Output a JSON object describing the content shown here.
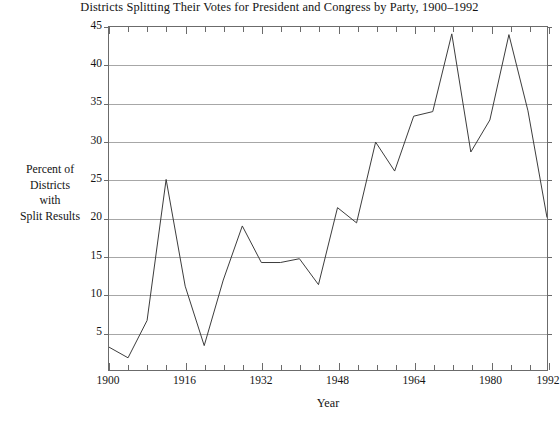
{
  "chart_data": {
    "type": "line",
    "title": "Districts Splitting Their Votes for President and Congress by Party, 1900–1992",
    "xlabel": "Year",
    "ylabel_lines": [
      "Percent of",
      "Districts",
      "with",
      "Split Results"
    ],
    "ylabel": "Percent of Districts with Split Results",
    "xlim": [
      1900,
      1992
    ],
    "ylim": [
      0,
      45
    ],
    "grid": true,
    "legend": "none",
    "ytick_labels": [
      "5",
      "10",
      "15",
      "20",
      "25",
      "30",
      "35",
      "40",
      "45"
    ],
    "yticks": [
      5,
      10,
      15,
      20,
      25,
      30,
      35,
      40,
      45
    ],
    "xtick_labels": [
      "1900",
      "1916",
      "1932",
      "1948",
      "1964",
      "1980",
      "1992"
    ],
    "xticks": [
      1900,
      1916,
      1932,
      1948,
      1964,
      1980,
      1992
    ],
    "x_minor_interval": 4,
    "x": [
      1900,
      1904,
      1908,
      1912,
      1916,
      1920,
      1924,
      1928,
      1932,
      1936,
      1940,
      1944,
      1948,
      1952,
      1956,
      1960,
      1964,
      1968,
      1972,
      1976,
      1980,
      1984,
      1988,
      1992
    ],
    "values": [
      3.0,
      1.6,
      6.5,
      25.0,
      11.0,
      3.2,
      11.8,
      18.9,
      14.1,
      14.1,
      14.6,
      11.2,
      21.3,
      19.3,
      29.9,
      26.1,
      33.3,
      33.9,
      44.1,
      28.6,
      32.8,
      44.0,
      34.0,
      20.0
    ],
    "series_color": "#3a3a3a",
    "grid_color": "#8a8a8a",
    "axis_color": "#6b6b6b"
  },
  "figure": {
    "background": "#ffffff",
    "bottom_artifact": ""
  }
}
